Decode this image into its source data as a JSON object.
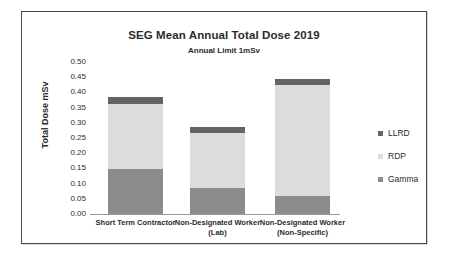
{
  "figure": {
    "title": "SEG Mean Annual Total Dose 2019",
    "subtitle": "Annual Limit 1mSv"
  },
  "axes": {
    "y_title": "Total Dose mSv",
    "y_ticks": [
      "0.50",
      "0.45",
      "0.40",
      "0.35",
      "0.30",
      "0.25",
      "0.20",
      "0.15",
      "0.10",
      "0.05",
      "0.00"
    ]
  },
  "legend": {
    "items": [
      {
        "label": "LLRD",
        "color": "#646464"
      },
      {
        "label": "RDP",
        "color": "#dcdcdc"
      },
      {
        "label": "Gamma",
        "color": "#8c8c8c"
      }
    ]
  },
  "categories_display": [
    {
      "line1": "Short Term Contractor",
      "line2": ""
    },
    {
      "line1": "Non-Designated Worker",
      "line2": "(Lab)"
    },
    {
      "line1": "Non-Designated Worker",
      "line2": "(Non-Specific)"
    }
  ],
  "chart_data": {
    "type": "bar",
    "stacked": true,
    "title": "SEG Mean Annual Total Dose 2019",
    "subtitle": "Annual Limit 1mSv",
    "xlabel": "",
    "ylabel": "Total Dose mSv",
    "ylim": [
      0.0,
      0.5
    ],
    "ytick_step": 0.05,
    "grid": false,
    "legend_position": "right",
    "categories": [
      "Short Term Contractor",
      "Non-Designated Worker (Lab)",
      "Non-Designated Worker (Non-Specific)"
    ],
    "series": [
      {
        "name": "Gamma",
        "color": "#8c8c8c",
        "values": [
          0.147,
          0.087,
          0.06
        ]
      },
      {
        "name": "RDP",
        "color": "#dcdcdc",
        "values": [
          0.216,
          0.181,
          0.365
        ]
      },
      {
        "name": "LLRD",
        "color": "#646464",
        "values": [
          0.022,
          0.017,
          0.02
        ]
      }
    ],
    "totals": [
      0.385,
      0.285,
      0.445
    ]
  },
  "render": {
    "plot_height_px": 152,
    "y_max": 0.5,
    "bar_width_px": 55,
    "bar_left_px": [
      18,
      100,
      185
    ]
  }
}
